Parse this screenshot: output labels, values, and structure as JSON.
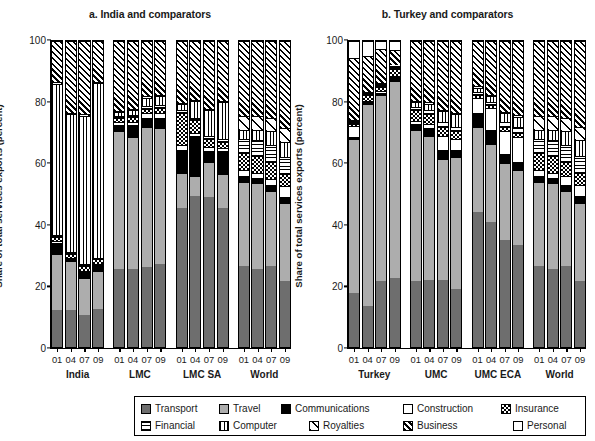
{
  "figure": {
    "y_axis_label": "Share of total services exports (percent)",
    "y_ticks": [
      0,
      20,
      40,
      60,
      80,
      100
    ],
    "ylim": [
      0,
      100
    ]
  },
  "chart_data": {
    "type": "bar",
    "subtype": "stacked-100-percent",
    "title": "",
    "xlabel": "",
    "ylabel": "Share of total services exports (percent)",
    "ylim": [
      0,
      100
    ],
    "yticks": [
      0,
      20,
      40,
      60,
      80,
      100
    ],
    "grid": false,
    "legend_position": "bottom",
    "categories_label": "year",
    "series": [
      {
        "name": "Transport",
        "pattern": "solid-dark-grey",
        "color": "#6e6e6e"
      },
      {
        "name": "Travel",
        "pattern": "solid-light-grey",
        "color": "#adadad"
      },
      {
        "name": "Communications",
        "pattern": "solid-black",
        "color": "#000000"
      },
      {
        "name": "Construction",
        "pattern": "plain-white",
        "color": "#ffffff"
      },
      {
        "name": "Insurance",
        "pattern": "checkerboard",
        "color": "#ffffff"
      },
      {
        "name": "Financial",
        "pattern": "horizontal-lines",
        "color": "#ffffff"
      },
      {
        "name": "Computer",
        "pattern": "vertical-lines",
        "color": "#ffffff"
      },
      {
        "name": "Royalties",
        "pattern": "sparse-diagonal",
        "color": "#ffffff"
      },
      {
        "name": "Business",
        "pattern": "diagonal-hatch",
        "color": "#ffffff"
      },
      {
        "name": "Personal",
        "pattern": "light-dots",
        "color": "#ffffff"
      }
    ],
    "panels": [
      {
        "id": "a",
        "title": "a. India and comparators",
        "groups": [
          {
            "name": "India",
            "years": [
              "01",
              "04",
              "07",
              "09"
            ],
            "bars": [
              {
                "year": "01",
                "values": [
                  12.0,
                  18.5,
                  3.5,
                  0.5,
                  1.5,
                  0.5,
                  49.5,
                  0.5,
                  13.5,
                  0.0
                ]
              },
              {
                "year": "04",
                "values": [
                  12.0,
                  16.0,
                  0.8,
                  0.3,
                  1.4,
                  0.5,
                  45.0,
                  0.5,
                  23.5,
                  0.0
                ]
              },
              {
                "year": "07",
                "values": [
                  10.5,
                  12.0,
                  2.0,
                  0.4,
                  1.6,
                  0.5,
                  48.5,
                  0.5,
                  24.0,
                  0.0
                ]
              },
              {
                "year": "09",
                "values": [
                  12.5,
                  12.5,
                  1.8,
                  0.4,
                  1.5,
                  0.5,
                  57.0,
                  0.5,
                  13.3,
                  0.0
                ]
              }
            ]
          },
          {
            "name": "LMC",
            "years": [
              "01",
              "04",
              "07",
              "09"
            ],
            "bars": [
              {
                "year": "01",
                "values": [
                  25.5,
                  45.0,
                  2.2,
                  0.7,
                  1.4,
                  0.7,
                  1.2,
                  0.4,
                  22.9,
                  0.0
                ]
              },
              {
                "year": "04",
                "values": [
                  25.5,
                  43.0,
                  4.0,
                  1.0,
                  1.6,
                  0.8,
                  1.5,
                  0.4,
                  22.2,
                  0.0
                ]
              },
              {
                "year": "07",
                "values": [
                  26.0,
                  46.0,
                  3.0,
                  1.5,
                  1.4,
                  1.0,
                  2.6,
                  0.4,
                  18.1,
                  0.0
                ]
              },
              {
                "year": "09",
                "values": [
                  27.0,
                  44.5,
                  3.5,
                  1.5,
                  1.5,
                  1.0,
                  3.0,
                  0.4,
                  17.6,
                  0.0
                ]
              }
            ]
          },
          {
            "name": "LMC SA",
            "years": [
              "01",
              "04",
              "07",
              "09"
            ],
            "bars": [
              {
                "year": "01",
                "values": [
                  45.5,
                  11.5,
                  7.5,
                  1.5,
                  10.5,
                  0.8,
                  2.0,
                  0.4,
                  20.3,
                  0.0
                ]
              },
              {
                "year": "04",
                "values": [
                  49.5,
                  6.5,
                  13.0,
                  0.8,
                  4.5,
                  0.6,
                  5.5,
                  0.4,
                  19.2,
                  0.0
                ]
              },
              {
                "year": "07",
                "values": [
                  49.0,
                  11.5,
                  3.5,
                  1.5,
                  2.5,
                  1.0,
                  8.5,
                  0.4,
                  22.1,
                  0.0
                ]
              },
              {
                "year": "09",
                "values": [
                  45.5,
                  11.0,
                  7.5,
                  1.0,
                  2.0,
                  1.0,
                  12.0,
                  0.4,
                  19.6,
                  0.0
                ]
              }
            ]
          },
          {
            "name": "World",
            "years": [
              "01",
              "04",
              "07",
              "09"
            ],
            "bars": [
              {
                "year": "01",
                "values": [
                  26.5,
                  27.5,
                  2.0,
                  2.0,
                  5.5,
                  4.5,
                  3.0,
                  4.5,
                  24.5,
                  0.0
                ]
              },
              {
                "year": "04",
                "values": [
                  25.5,
                  28.0,
                  1.8,
                  1.7,
                  5.5,
                  5.0,
                  3.5,
                  4.5,
                  24.5,
                  0.0
                ]
              },
              {
                "year": "07",
                "values": [
                  26.5,
                  24.5,
                  2.0,
                  2.0,
                  5.5,
                  5.5,
                  4.5,
                  4.5,
                  25.0,
                  0.0
                ]
              },
              {
                "year": "09",
                "values": [
                  21.5,
                  25.5,
                  2.0,
                  3.5,
                  4.0,
                  5.5,
                  5.0,
                  4.5,
                  28.5,
                  0.0
                ]
              }
            ]
          }
        ]
      },
      {
        "id": "b",
        "title": "b. Turkey and comparators",
        "groups": [
          {
            "name": "Turkey",
            "years": [
              "01",
              "04",
              "07",
              "09"
            ],
            "bars": [
              {
                "year": "01",
                "values": [
                  17.5,
                  50.5,
                  0.7,
                  3.5,
                  0.8,
                  0.5,
                  0.3,
                  0.4,
                  20.3,
                  5.5
                ]
              },
              {
                "year": "04",
                "values": [
                  13.5,
                  66.0,
                  0.5,
                  0.4,
                  2.0,
                  0.4,
                  0.3,
                  0.4,
                  11.5,
                  5.0
                ]
              },
              {
                "year": "07",
                "values": [
                  21.5,
                  61.0,
                  0.6,
                  0.5,
                  1.5,
                  0.5,
                  0.4,
                  0.4,
                  11.0,
                  2.6
                ]
              },
              {
                "year": "09",
                "values": [
                  22.5,
                  64.5,
                  1.2,
                  0.5,
                  2.0,
                  0.5,
                  0.4,
                  0.4,
                  5.0,
                  3.0
                ]
              }
            ]
          },
          {
            "name": "UMC",
            "years": [
              "01",
              "04",
              "07",
              "09"
            ],
            "bars": [
              {
                "year": "01",
                "values": [
                  21.5,
                  49.5,
                  2.0,
                  1.0,
                  3.5,
                  1.0,
                  1.5,
                  0.5,
                  19.5,
                  0.0
                ]
              },
              {
                "year": "04",
                "values": [
                  22.0,
                  47.0,
                  2.5,
                  1.5,
                  3.0,
                  1.5,
                  2.0,
                  0.5,
                  20.0,
                  0.0
                ]
              },
              {
                "year": "07",
                "values": [
                  22.0,
                  39.5,
                  3.0,
                  4.5,
                  3.0,
                  1.5,
                  3.5,
                  0.5,
                  22.5,
                  0.0
                ]
              },
              {
                "year": "09",
                "values": [
                  19.0,
                  43.0,
                  2.5,
                  3.5,
                  2.5,
                  1.5,
                  4.0,
                  0.5,
                  23.5,
                  0.0
                ]
              }
            ]
          },
          {
            "name": "UMC ECA",
            "years": [
              "01",
              "04",
              "07",
              "09"
            ],
            "bars": [
              {
                "year": "01",
                "values": [
                  44.0,
                  28.0,
                  4.5,
                  5.0,
                  1.0,
                  0.8,
                  1.5,
                  0.4,
                  14.8,
                  0.0
                ]
              },
              {
                "year": "04",
                "values": [
                  41.0,
                  25.5,
                  4.5,
                  7.0,
                  1.0,
                  1.0,
                  2.0,
                  0.4,
                  17.6,
                  0.0
                ]
              },
              {
                "year": "07",
                "values": [
                  35.0,
                  25.0,
                  3.0,
                  7.5,
                  1.5,
                  1.5,
                  3.0,
                  0.4,
                  23.1,
                  0.0
                ]
              },
              {
                "year": "09",
                "values": [
                  33.5,
                  24.5,
                  2.5,
                  8.0,
                  1.5,
                  1.8,
                  3.5,
                  0.4,
                  24.3,
                  0.0
                ]
              }
            ]
          },
          {
            "name": "World",
            "years": [
              "01",
              "04",
              "07",
              "09"
            ],
            "bars": [
              {
                "year": "01",
                "values": [
                  26.5,
                  27.5,
                  2.0,
                  2.0,
                  5.5,
                  4.5,
                  3.0,
                  4.5,
                  24.5,
                  0.0
                ]
              },
              {
                "year": "04",
                "values": [
                  25.5,
                  28.0,
                  1.8,
                  1.7,
                  5.5,
                  5.0,
                  3.5,
                  4.5,
                  24.5,
                  0.0
                ]
              },
              {
                "year": "07",
                "values": [
                  26.5,
                  24.5,
                  2.0,
                  3.0,
                  4.5,
                  5.5,
                  4.5,
                  4.5,
                  25.0,
                  0.0
                ]
              },
              {
                "year": "09",
                "values": [
                  21.5,
                  25.5,
                  2.5,
                  3.5,
                  4.0,
                  5.5,
                  5.0,
                  4.5,
                  28.0,
                  0.0
                ]
              }
            ]
          }
        ]
      }
    ]
  },
  "legend": {
    "rows": [
      [
        {
          "label": "Transport",
          "key": "transport"
        },
        {
          "label": "Travel",
          "key": "travel"
        },
        {
          "label": "Communications",
          "key": "communications"
        },
        {
          "label": "Construction",
          "key": "construction"
        },
        {
          "label": "Insurance",
          "key": "insurance"
        }
      ],
      [
        {
          "label": "Financial",
          "key": "financial"
        },
        {
          "label": "Computer",
          "key": "computer"
        },
        {
          "label": "Royalties",
          "key": "royalties"
        },
        {
          "label": "Business",
          "key": "business"
        },
        {
          "label": "Personal",
          "key": "personal"
        }
      ]
    ]
  }
}
